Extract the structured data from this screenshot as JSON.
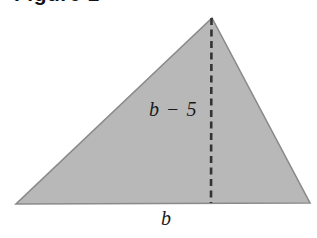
{
  "figure": {
    "heading": "Figure 1",
    "background_color": "#ffffff"
  },
  "shape": {
    "name": "triangle",
    "fill_color": "#b8b8b8",
    "stroke_color": "#8a8a8a",
    "vertices": {
      "apex": [
        212,
        18
      ],
      "bottom_left": [
        16,
        204
      ],
      "bottom_right": [
        310,
        203
      ]
    }
  },
  "altitude": {
    "name": "dashed-height-line",
    "color": "#333333",
    "from": [
      212,
      18
    ],
    "to": [
      211,
      203
    ],
    "style": "dashed"
  },
  "labels": {
    "height": "b − 5",
    "base": "b"
  }
}
